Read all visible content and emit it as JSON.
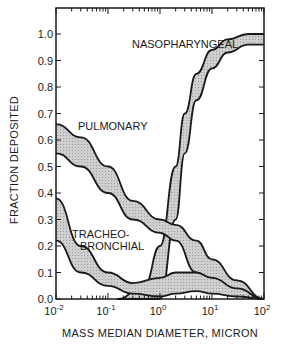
{
  "chart_data": {
    "type": "area",
    "title": "",
    "xlabel": "MASS MEDIAN DIAMETER, MICRON",
    "ylabel": "FRACTION DEPOSITED",
    "xscale": "log",
    "xlim": [
      0.01,
      100
    ],
    "ylim": [
      0.0,
      1.08
    ],
    "x_tick_labels": [
      "10^-2",
      "10^-1",
      "10^0",
      "10^1",
      "10^2"
    ],
    "y_tick_labels": [
      "0.0",
      "0.1",
      "0.2",
      "0.3",
      "0.4",
      "0.5",
      "0.6",
      "0.7",
      "0.8",
      "0.9",
      "1.0"
    ],
    "grid": false,
    "legend": "none (bands labeled inline)",
    "series": [
      {
        "name": "NASOPHARYNGEAL",
        "x": [
          0.15,
          0.5,
          1,
          2,
          3,
          5,
          10,
          20,
          50,
          100
        ],
        "upper": [
          0.0,
          0.05,
          0.2,
          0.5,
          0.7,
          0.85,
          0.94,
          0.98,
          1.0,
          1.0
        ],
        "lower": [
          0.0,
          0.0,
          0.0,
          0.3,
          0.55,
          0.75,
          0.87,
          0.93,
          0.96,
          0.96
        ]
      },
      {
        "name": "PULMONARY",
        "x": [
          0.01,
          0.03,
          0.1,
          0.3,
          1,
          2,
          5,
          10,
          30,
          100
        ],
        "upper": [
          0.66,
          0.61,
          0.5,
          0.37,
          0.3,
          0.28,
          0.22,
          0.15,
          0.07,
          0.0
        ],
        "lower": [
          0.55,
          0.5,
          0.4,
          0.3,
          0.25,
          0.22,
          0.1,
          0.04,
          0.01,
          0.0
        ]
      },
      {
        "name": "TRACHEO-BRONCHIAL",
        "x": [
          0.01,
          0.03,
          0.1,
          0.3,
          1,
          2,
          5,
          10,
          30,
          100
        ],
        "upper": [
          0.38,
          0.2,
          0.1,
          0.06,
          0.08,
          0.1,
          0.1,
          0.08,
          0.04,
          0.0
        ],
        "lower": [
          0.22,
          0.1,
          0.05,
          0.02,
          0.01,
          0.02,
          0.03,
          0.02,
          0.01,
          0.0
        ]
      }
    ],
    "annotations": [
      "NASOPHARYNGEAL",
      "PULMONARY",
      "TRACHEO-",
      "BRONCHIAL"
    ]
  }
}
